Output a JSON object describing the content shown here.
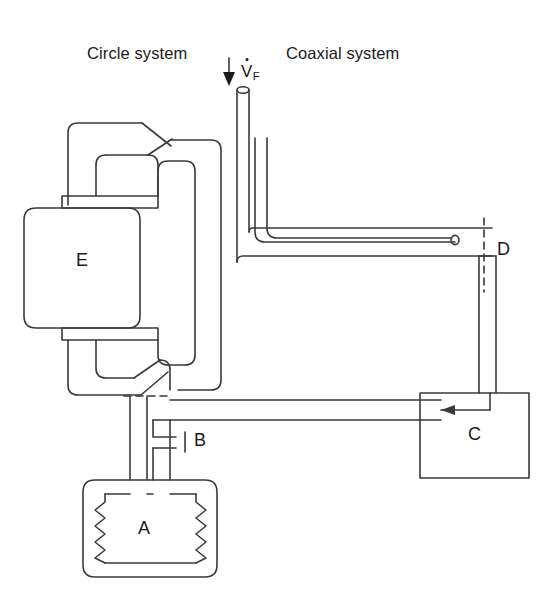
{
  "figure": {
    "type": "schematic-diagram",
    "background_color": "#ffffff",
    "line_color": "#3a3a3a",
    "text_color": "#1a1a1a"
  },
  "headings": {
    "left": "Circle system",
    "right": "Coaxial system"
  },
  "flow_label": {
    "symbol": "V",
    "subscript": "F",
    "overdot": true,
    "full_text": "V̇F",
    "meaning": "fresh gas flow",
    "arrow_direction": "down"
  },
  "components": [
    {
      "id": "A",
      "label": "A",
      "name": "bellows-ventilator",
      "shape": "rounded-box-with-bellows"
    },
    {
      "id": "B",
      "label": "B",
      "name": "valve-port",
      "shape": "tick-mark-port"
    },
    {
      "id": "C",
      "label": "C",
      "name": "reservoir-box",
      "shape": "rectangle"
    },
    {
      "id": "D",
      "label": "D",
      "name": "patient-connection",
      "shape": "dashed-section-line"
    },
    {
      "id": "E",
      "label": "E",
      "name": "co2-absorber-canister",
      "shape": "rounded-rectangle"
    }
  ],
  "valves": [
    {
      "name": "inspiratory-one-way-valve",
      "position": "upper-circle-limb"
    },
    {
      "name": "expiratory-one-way-valve",
      "position": "lower-circle-limb"
    }
  ],
  "arrows": [
    {
      "name": "fresh-gas-inlet-arrow",
      "direction": "down"
    },
    {
      "name": "reservoir-outflow-arrow",
      "direction": "left"
    }
  ],
  "section_markers": [
    {
      "name": "dashed-marker-left",
      "orientation": "horizontal"
    },
    {
      "name": "dashed-marker-right",
      "orientation": "vertical"
    }
  ]
}
